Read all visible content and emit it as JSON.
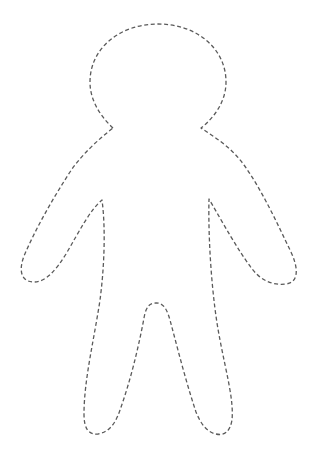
{
  "figure": {
    "style": "dashed",
    "stroke_color": "#5a5a5a",
    "background_color": "#ffffff"
  }
}
